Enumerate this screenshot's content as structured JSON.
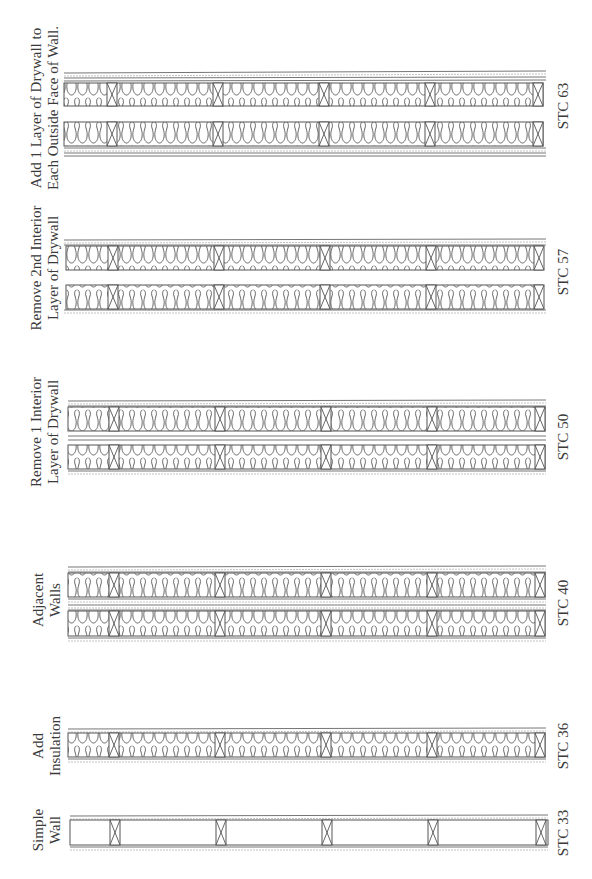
{
  "diagram": {
    "type": "wall-assembly-comparison",
    "orientation": "rotated-90-ccw",
    "colors": {
      "line": "#555555",
      "background": "#ffffff",
      "text": "#3a3a3a"
    },
    "assemblies": [
      {
        "id": "simple-wall",
        "label_lines": [
          "Simple",
          "Wall"
        ],
        "stc": "STC 33",
        "walls": 1,
        "insulation": false,
        "drywall_layers_outer": 1
      },
      {
        "id": "add-insulation",
        "label_lines": [
          "Add",
          "Insulation"
        ],
        "stc": "STC 36",
        "walls": 1,
        "insulation": true,
        "drywall_layers_outer": 1
      },
      {
        "id": "adjacent-walls",
        "label_lines": [
          "Adjacent",
          "Walls"
        ],
        "stc": "STC 40",
        "walls": 2,
        "insulation": true,
        "drywall_layers_outer": 1,
        "drywall_layers_interior": 2
      },
      {
        "id": "remove-1-interior",
        "label_lines": [
          "Remove  1 Interior",
          "Layer of Drywall"
        ],
        "stc": "STC 50",
        "walls": 2,
        "insulation": true,
        "drywall_layers_outer": 1,
        "drywall_layers_interior": 1
      },
      {
        "id": "remove-2nd-interior",
        "label_lines": [
          "Remove 2nd Interior",
          "Layer of Drywall"
        ],
        "stc": "STC 57",
        "walls": 2,
        "insulation": true,
        "drywall_layers_outer": 1,
        "drywall_layers_interior": 0
      },
      {
        "id": "add-outside-drywall",
        "label_lines": [
          "Add 1 Layer of Drywall to",
          "Each Outside Face of Wall."
        ],
        "stc": "STC 63",
        "walls": 2,
        "insulation": true,
        "drywall_layers_outer": 2,
        "drywall_layers_interior": 0
      }
    ]
  }
}
